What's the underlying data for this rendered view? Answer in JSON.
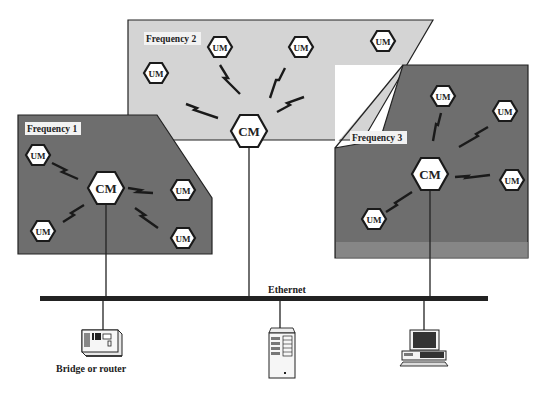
{
  "diagram": {
    "regions": [
      {
        "id": "freq1",
        "label": "Frequency 1",
        "fill": "#6e6e6e"
      },
      {
        "id": "freq2",
        "label": "Frequency 2",
        "fill": "#d4d4d4"
      },
      {
        "id": "freq3",
        "label": "Frequency 3",
        "fill": "#6e6e6e"
      }
    ],
    "nodes": {
      "cm": "CM",
      "um": "UM"
    },
    "network": {
      "bus_label": "Ethernet",
      "devices": [
        {
          "id": "bridge",
          "label": "Bridge or router"
        },
        {
          "id": "server",
          "label": ""
        },
        {
          "id": "workstation",
          "label": ""
        }
      ]
    }
  }
}
